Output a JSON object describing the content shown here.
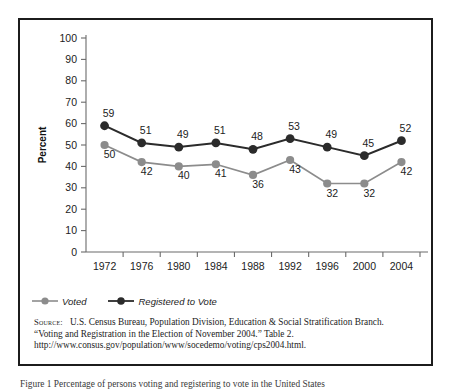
{
  "chart_data": {
    "type": "line",
    "title": "",
    "xlabel": "",
    "ylabel": "Percent",
    "ylim": [
      0,
      100
    ],
    "ytick_step": 10,
    "yticks": [
      0,
      10,
      20,
      30,
      40,
      50,
      60,
      70,
      80,
      90,
      100
    ],
    "grid": false,
    "legend_position": "below-axis-left",
    "categories": [
      "1972",
      "1976",
      "1980",
      "1984",
      "1988",
      "1992",
      "1996",
      "2000",
      "2004"
    ],
    "series": [
      {
        "name": "Voted",
        "color": "#8c8c8c",
        "values": [
          50,
          42,
          40,
          41,
          36,
          43,
          32,
          32,
          42
        ]
      },
      {
        "name": "Registered to Vote",
        "color": "#2b2b2b",
        "values": [
          59,
          51,
          49,
          51,
          48,
          53,
          49,
          45,
          52
        ]
      }
    ]
  },
  "legend": {
    "items": [
      {
        "label": "Voted",
        "color": "#8c8c8c"
      },
      {
        "label": "Registered to Vote",
        "color": "#2b2b2b"
      }
    ]
  },
  "source": {
    "label": "Source:",
    "line1": "U.S. Census Bureau, Population Division, Education & Social Stratification Branch.",
    "line2": "“Voting and Registration in the Election of November 2004.” Table 2.",
    "line3": "http://www.consus.gov/population/www/socedemo/voting/cps2004.html."
  },
  "caption": {
    "text": "Figure 1  Percentage of persons voting and registering to vote in the United States"
  }
}
